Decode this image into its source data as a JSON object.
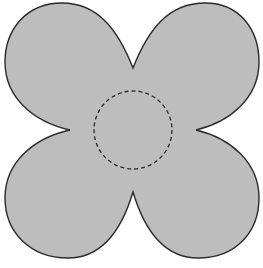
{
  "diagram": {
    "shape": "four-petal-flower",
    "fill_color": "#bdbdbd",
    "stroke_color": "#2a2a2a",
    "center_circle": {
      "style": "dashed",
      "color": "#2a2a2a"
    }
  }
}
